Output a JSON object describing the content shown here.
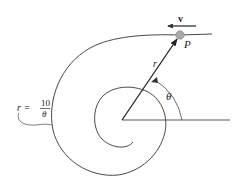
{
  "figure": {
    "labels": {
      "velocity": "v",
      "particle": "P",
      "radius": "r",
      "angle": "θ",
      "equation_lhs": "r =",
      "equation_num": "10",
      "equation_den": "θ"
    },
    "colors": {
      "stroke": "#333333",
      "particle_fill": "#a8a8a8",
      "background": "#ffffff"
    },
    "spiral_equation": "r = 10/θ"
  }
}
